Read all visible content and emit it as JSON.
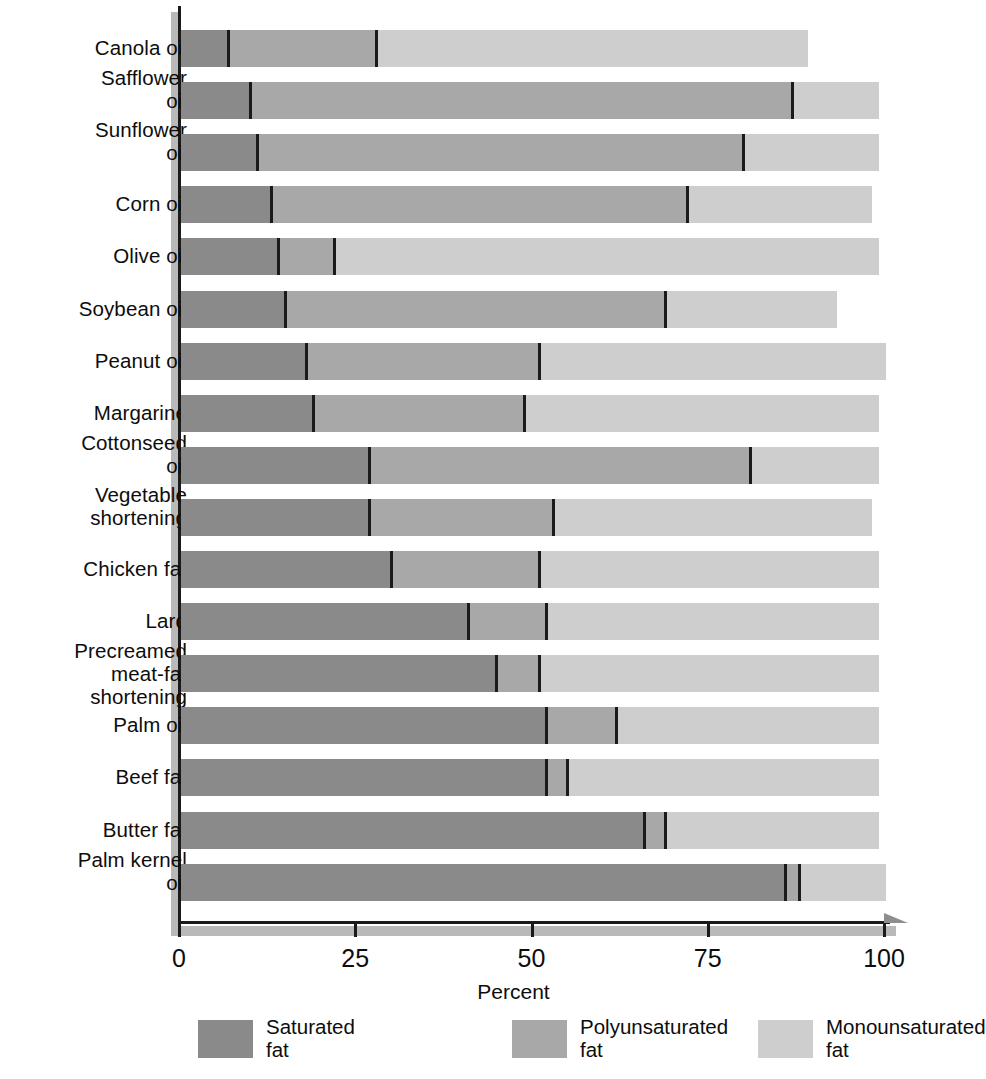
{
  "chart_data": {
    "type": "bar",
    "orientation": "horizontal",
    "stacked": true,
    "title": "",
    "xlabel": "Percent",
    "ylabel": "",
    "xlim": [
      0,
      100
    ],
    "xticks": [
      0,
      25,
      50,
      75,
      100
    ],
    "xtick_labels": [
      "0",
      "25",
      "50",
      "75",
      "100"
    ],
    "grid": false,
    "legend_position": "bottom",
    "categories": [
      "Canola oil",
      "Safflower oil",
      "Sunflower oil",
      "Corn oil",
      "Olive oil",
      "Soybean oil",
      "Peanut oil",
      "Margarine",
      "Cottonseed oil",
      "Vegetable shortening",
      "Chicken fat",
      "Lard",
      "Precreamed meat-fat shortening",
      "Palm oil",
      "Beef fat",
      "Butter fat",
      "Palm kernel oil"
    ],
    "category_lines": [
      [
        "Canola oil"
      ],
      [
        "Safflower",
        "oil"
      ],
      [
        "Sunflower",
        "oil"
      ],
      [
        "Corn oil"
      ],
      [
        "Olive oil"
      ],
      [
        "Soybean oil"
      ],
      [
        "Peanut oil"
      ],
      [
        "Margarine"
      ],
      [
        "Cottonseed",
        "oil"
      ],
      [
        "Vegetable",
        "shortening"
      ],
      [
        "Chicken fat"
      ],
      [
        "Lard"
      ],
      [
        "Precreamed",
        "meat-fat shortening"
      ],
      [
        "Palm oil"
      ],
      [
        "Beef fat"
      ],
      [
        "Butter fat"
      ],
      [
        "Palm kernel",
        "oil"
      ]
    ],
    "series": [
      {
        "name": "Saturated fat",
        "color": "#8a8a8a",
        "values": [
          7,
          10,
          11,
          13,
          14,
          15,
          18,
          19,
          27,
          27,
          30,
          41,
          45,
          52,
          52,
          66,
          86
        ]
      },
      {
        "name": "Polyunsaturated fat",
        "color": "#a8a8a8",
        "values": [
          21,
          77,
          69,
          59,
          8,
          54,
          33,
          30,
          54,
          26,
          21,
          11,
          6,
          10,
          3,
          3,
          2
        ]
      },
      {
        "name": "Monounsaturated fat",
        "color": "#cecece",
        "values": [
          61,
          12,
          19,
          26,
          77,
          24,
          49,
          50,
          18,
          45,
          48,
          47,
          48,
          37,
          44,
          30,
          12
        ]
      }
    ],
    "segment_ends": {
      "Canola oil": [
        7,
        28,
        89
      ],
      "Safflower oil": [
        10,
        87,
        99
      ],
      "Sunflower oil": [
        11,
        80,
        99
      ],
      "Corn oil": [
        13,
        72,
        98
      ],
      "Olive oil": [
        14,
        22,
        99
      ],
      "Soybean oil": [
        15,
        69,
        93
      ],
      "Peanut oil": [
        18,
        51,
        100
      ],
      "Margarine": [
        19,
        49,
        99
      ],
      "Cottonseed oil": [
        27,
        81,
        99
      ],
      "Vegetable shortening": [
        27,
        53,
        98
      ],
      "Chicken fat": [
        30,
        51,
        99
      ],
      "Lard": [
        41,
        52,
        99
      ],
      "Precreamed meat-fat shortening": [
        45,
        51,
        99
      ],
      "Palm oil": [
        52,
        62,
        99
      ],
      "Beef fat": [
        52,
        55,
        99
      ],
      "Butter fat": [
        66,
        69,
        99
      ],
      "Palm kernel oil": [
        86,
        88,
        100
      ]
    }
  },
  "legend": {
    "items": [
      {
        "label_line1": "Saturated",
        "label_line2": "fat",
        "color": "#8a8a8a"
      },
      {
        "label_line1": "Polyunsaturated",
        "label_line2": "fat",
        "color": "#a8a8a8"
      },
      {
        "label_line1": "Monounsaturated",
        "label_line2": "fat",
        "color": "#cecece"
      }
    ]
  }
}
